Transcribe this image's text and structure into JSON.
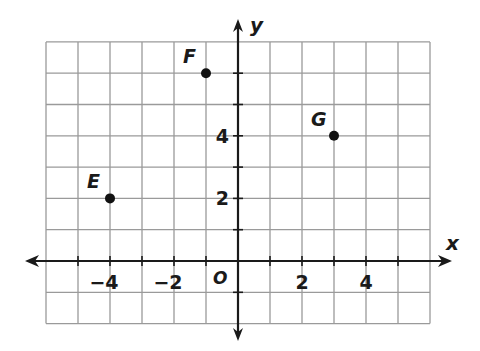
{
  "chart_data": {
    "type": "scatter",
    "title": "",
    "xlabel": "x",
    "ylabel": "y",
    "origin_label": "O",
    "xlim": [
      -6,
      6
    ],
    "ylim": [
      -2,
      7
    ],
    "grid": true,
    "x_ticks": [
      -6,
      -5,
      -4,
      -3,
      -2,
      -1,
      0,
      1,
      2,
      3,
      4,
      5
    ],
    "x_tick_labels": [
      {
        "value": -4,
        "label": "−4"
      },
      {
        "value": -2,
        "label": "−2"
      },
      {
        "value": 2,
        "label": "2"
      },
      {
        "value": 4,
        "label": "4"
      }
    ],
    "y_tick_labels": [
      {
        "value": 2,
        "label": "2"
      },
      {
        "value": 4,
        "label": "4"
      }
    ],
    "points": [
      {
        "label": "E",
        "x": -4,
        "y": 2
      },
      {
        "label": "F",
        "x": -1,
        "y": 6
      },
      {
        "label": "G",
        "x": 3,
        "y": 4
      }
    ],
    "colors": {
      "grid": "#9a9a9a",
      "axis": "#1a1a1a",
      "point": "#111111"
    }
  }
}
